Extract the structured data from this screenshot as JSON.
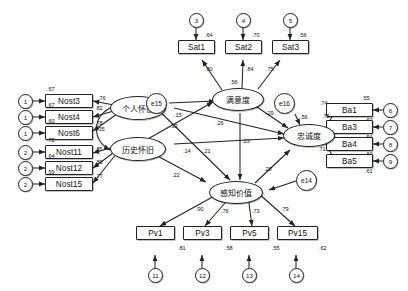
{
  "diagram": {
    "type": "sem-path-diagram"
  },
  "latents": {
    "personal_nostalgia": {
      "label": "个人怀旧",
      "x": 118,
      "y": 98,
      "w": 56,
      "h": 24
    },
    "historical_nostalgia": {
      "label": "历史怀旧",
      "x": 118,
      "y": 138,
      "w": 56,
      "h": 24
    },
    "satisfaction": {
      "label": "满意度",
      "x": 216,
      "y": 90,
      "w": 52,
      "h": 23
    },
    "loyalty": {
      "label": "忠诚度",
      "x": 287,
      "y": 126,
      "w": 52,
      "h": 23
    },
    "perceived_value": {
      "label": "感知价值",
      "x": 213,
      "y": 183,
      "w": 54,
      "h": 23
    }
  },
  "nostalgia_indicators": [
    {
      "name": "Nost3",
      "r2": ".57",
      "loading": ".76",
      "error": "1",
      "x": 56,
      "y": 94
    },
    {
      "name": "Nost4",
      "r2": ".67",
      "loading": ".82",
      "error": "1",
      "x": 56,
      "y": 110
    },
    {
      "name": "Nost6",
      "r2": ".60",
      "loading": ".78",
      "error": "1",
      "x": 56,
      "y": 126
    },
    {
      "name": "Nost11",
      "r2": ".72",
      "loading": ".85",
      "error": "2",
      "x": 56,
      "y": 145
    },
    {
      "name": "Nost12",
      "r2": ".64",
      "loading": ".80",
      "error": "2",
      "x": 56,
      "y": 161
    },
    {
      "name": "Nost15",
      "r2": ".59",
      "loading": ".77",
      "error": "2",
      "x": 56,
      "y": 177
    }
  ],
  "satisfaction_indicators": [
    {
      "name": "Sat1",
      "r2": ".64",
      "loading": ".80",
      "error": "3",
      "x": 186,
      "y": 46
    },
    {
      "name": "Sat2",
      "r2": ".70",
      "loading": ".84",
      "error": "4",
      "x": 233,
      "y": 46
    },
    {
      "name": "Sat3",
      "r2": ".56",
      "loading": ".75",
      "error": "5",
      "x": 280,
      "y": 46
    }
  ],
  "loyalty_indicators": [
    {
      "name": "Ba1",
      "r2": ".55",
      "loading": ".74",
      "err_val": ".63",
      "error": "6",
      "x": 344,
      "y": 106
    },
    {
      "name": "Ba3",
      "r2": "",
      "loading": ".75",
      "err_val": ".54",
      "error": "7",
      "x": 344,
      "y": 123
    },
    {
      "name": "Ba4",
      "r2": "",
      "loading": ".73",
      "err_val": ".60",
      "error": "8",
      "x": 344,
      "y": 140
    },
    {
      "name": "Ba5",
      "r2": "",
      "loading": ".71",
      "err_val": ".61",
      "error": "9",
      "x": 344,
      "y": 157
    }
  ],
  "value_indicators": [
    {
      "name": "Pv1",
      "loading": ".90",
      "r2": ".81",
      "error": "11",
      "x": 144,
      "y": 233
    },
    {
      "name": "Pv3",
      "loading": ".76",
      "r2": ".58",
      "error": "12",
      "x": 191,
      "y": 233
    },
    {
      "name": "Pv5",
      "loading": ".73",
      "r2": ".55",
      "error": "13",
      "x": 238,
      "y": 233
    },
    {
      "name": "Pv15",
      "loading": ".79",
      "r2": ".62",
      "error": "14",
      "x": 285,
      "y": 233
    }
  ],
  "disturbances": [
    {
      "label": "e15",
      "value": ".15",
      "x": 152,
      "y": 99
    },
    {
      "label": "e16",
      "value": ".56",
      "x": 283,
      "y": 100
    },
    {
      "label": "e14",
      "value": "",
      "x": 305,
      "y": 182
    }
  ],
  "path_coefficients": {
    "correlation_nostalgia": ".35",
    "pn_to_satisfaction": ".33",
    "pn_to_value": ".14",
    "pn_to_loyalty": ".21",
    "hn_to_value": ".22",
    "hn_to_loyalty": ".23",
    "sat_r2": ".56",
    "sat_to_loyalty": ".29",
    "value_to_satisfaction": ".26",
    "value_to_loyalty": ".28",
    "satisfaction_value_cross": ".23"
  },
  "colors": {
    "stroke": "#222222",
    "background": "#fefefe",
    "text": "#111111"
  }
}
